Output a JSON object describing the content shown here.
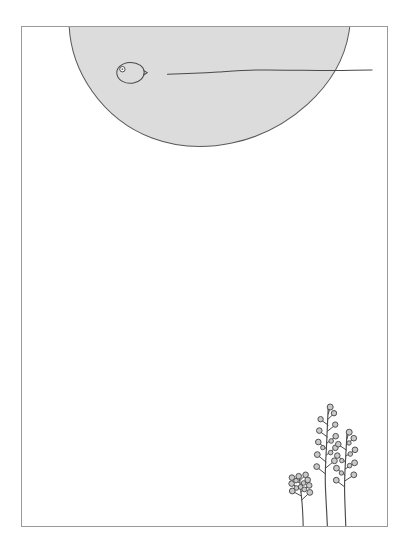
{
  "artwork": {
    "title": "Minimal Pen And Ink Landscape",
    "description": "A thin rectangular frame enclosing a light grey semicircular sun or hill crossing the upper border, a small fish-like oval with an eye floating inside the grey shape, a long wavy horizon line running to the right edge, and three stylised berry plants rising from the bottom border at the right.",
    "background_color": "#ffffff",
    "ink_color": "#4a4a4a",
    "frame_color": "#9a9a9a",
    "grey_fill_color": "#dcdcdc",
    "grey_outline_color": "#5a5a5a",
    "berry_fill_color": "#c9c9c9",
    "canvas": {
      "width": 412,
      "height": 556
    }
  },
  "frame": {
    "name": "picture-frame",
    "x": 21,
    "y": 26,
    "width": 367,
    "height": 501,
    "stroke_width": 1
  },
  "elements": {
    "sun": {
      "label": "grey-semicircle-sun",
      "center_x": 210,
      "top_y": 26,
      "bottom_y": 143,
      "left_x": 71,
      "right_x": 348
    },
    "fish": {
      "label": "fish-shape",
      "body_center_x": 130,
      "body_center_y": 73,
      "body_rx": 13,
      "body_ry": 10,
      "eye_x": 122,
      "eye_y": 69,
      "eye_r": 2.6,
      "tail_tip_x": 147,
      "tail_tip_y": 73
    },
    "horizon": {
      "label": "wavy-horizon-line",
      "start_x": 167,
      "end_x": 372,
      "base_y": 71
    },
    "plants": [
      {
        "label": "plant-short-left",
        "base_x": 303,
        "base_y": 527,
        "top_y": 478,
        "berry_count": 13,
        "height": 49
      },
      {
        "label": "plant-tall-middle",
        "base_x": 327,
        "base_y": 527,
        "top_y": 407,
        "berry_count": 14,
        "height": 120
      },
      {
        "label": "plant-medium-right",
        "base_x": 346,
        "base_y": 527,
        "top_y": 432,
        "berry_count": 14,
        "height": 95
      }
    ]
  }
}
